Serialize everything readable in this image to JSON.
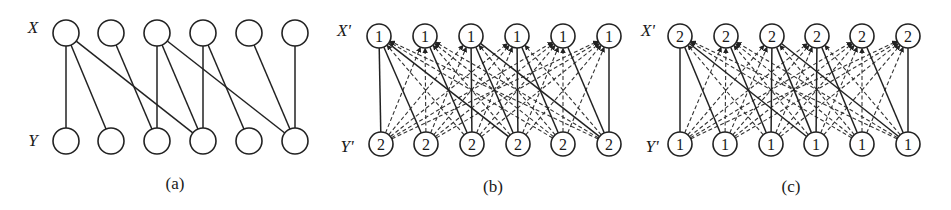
{
  "figure": {
    "panels": [
      {
        "id": "a",
        "caption": "(a)",
        "top_label": "X",
        "bottom_label": "Y",
        "top_node_values": [
          "",
          "",
          "",
          "",
          "",
          ""
        ],
        "bottom_node_values": [
          "",
          "",
          "",
          "",
          "",
          ""
        ],
        "top_x": [
          66,
          111,
          157,
          203,
          249,
          295
        ],
        "bottom_x": [
          66,
          111,
          157,
          203,
          249,
          295
        ],
        "top_y": 33,
        "bottom_y": 141,
        "radius": 13,
        "top_label_pos": [
          33,
          33
        ],
        "bottom_label_pos": [
          33,
          146
        ],
        "caption_pos": [
          175,
          189
        ],
        "show_complement_dashed": false
      },
      {
        "id": "b",
        "caption": "(b)",
        "top_label": "X'",
        "bottom_label": "Y'",
        "top_node_values": [
          "1",
          "1",
          "1",
          "1",
          "1",
          "1"
        ],
        "bottom_node_values": [
          "2",
          "2",
          "2",
          "2",
          "2",
          "2"
        ],
        "top_x": [
          379,
          425,
          471,
          517,
          563,
          609
        ],
        "bottom_x": [
          381,
          426,
          472,
          518,
          563,
          609
        ],
        "top_y": 36,
        "bottom_y": 144,
        "radius": 12,
        "top_label_pos": [
          344,
          36
        ],
        "bottom_label_pos": [
          347,
          152
        ],
        "caption_pos": [
          493,
          192
        ],
        "show_complement_dashed": true
      },
      {
        "id": "c",
        "caption": "(c)",
        "top_label": "X'",
        "bottom_label": "Y'",
        "top_node_values": [
          "2",
          "2",
          "2",
          "2",
          "2",
          "2"
        ],
        "bottom_node_values": [
          "1",
          "1",
          "1",
          "1",
          "1",
          "1"
        ],
        "top_x": [
          680,
          726,
          772,
          817,
          862,
          908
        ],
        "bottom_x": [
          680,
          725,
          771,
          816,
          862,
          908
        ],
        "top_y": 36,
        "bottom_y": 144,
        "radius": 12,
        "top_label_pos": [
          648,
          36
        ],
        "bottom_label_pos": [
          652,
          152
        ],
        "caption_pos": [
          791,
          192
        ],
        "show_complement_dashed": true
      }
    ],
    "solid_edges": [
      [
        1,
        1
      ],
      [
        1,
        2
      ],
      [
        1,
        4
      ],
      [
        2,
        3
      ],
      [
        3,
        3
      ],
      [
        3,
        4
      ],
      [
        3,
        6
      ],
      [
        4,
        4
      ],
      [
        4,
        5
      ],
      [
        5,
        6
      ],
      [
        6,
        6
      ]
    ],
    "colors": {
      "stroke": "#222222",
      "dashed": "#333333",
      "background": "#ffffff"
    }
  }
}
